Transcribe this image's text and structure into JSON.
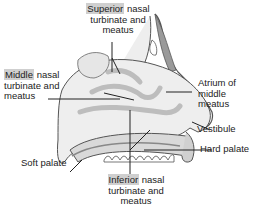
{
  "diagram": {
    "colors": {
      "highlight": "#cfcfcf",
      "tissue_light": "#eeeeee",
      "tissue_mid": "#bdbdbd",
      "tissue_dark": "#8a8a8a",
      "outline": "#555555",
      "leader": "#222222"
    },
    "labels": [
      {
        "id": "superior",
        "highlight": "Superior",
        "line1_rest": " nasal",
        "line2": "turbinate and",
        "line3": "meatus"
      },
      {
        "id": "middle",
        "highlight": "Middle",
        "line1_rest": " nasal",
        "line2": "turbinate and",
        "line3": "meatus"
      },
      {
        "id": "atrium",
        "line1": "Atrium of",
        "line2": "middle",
        "line3": "meatus"
      },
      {
        "id": "vestibule",
        "line1": "Vestibule"
      },
      {
        "id": "hard_palate",
        "line1": "Hard palate"
      },
      {
        "id": "soft_palate",
        "line1": "Soft palate"
      },
      {
        "id": "inferior",
        "highlight": "Inferior",
        "line1_rest": " nasal",
        "line2": "turbinate and",
        "line3": "meatus"
      }
    ]
  }
}
